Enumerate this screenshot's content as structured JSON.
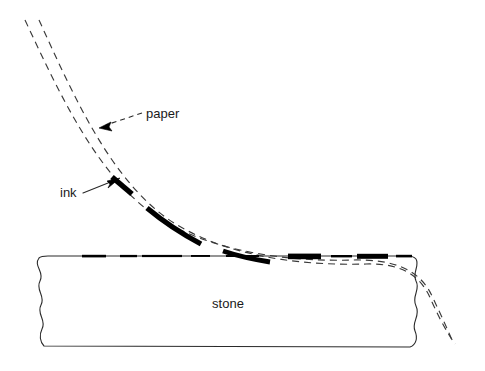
{
  "figure": {
    "type": "technical-cross-section-diagram",
    "background_color": "#ffffff",
    "line_color": "#1a1a1a",
    "ink_color": "#000000"
  },
  "labels": {
    "paper": "paper",
    "ink": "ink",
    "stone": "stone"
  },
  "label_positions": {
    "paper": {
      "x": 146,
      "y": 115,
      "anchor": "start"
    },
    "ink": {
      "x": 60,
      "y": 194,
      "anchor": "start"
    },
    "stone": {
      "x": 228,
      "y": 305,
      "anchor": "middle"
    }
  },
  "leaders": {
    "paper": {
      "style": "dashed",
      "path": "M 142 114 L 101 127",
      "arrow_at": {
        "x": 99,
        "y": 128
      },
      "arrow_angle_deg": 198
    },
    "ink": {
      "style": "solid",
      "path": "M 84 192 L 116 180",
      "arrow_at": {
        "x": 118,
        "y": 179
      },
      "arrow_angle_deg": -21
    }
  },
  "geometry": {
    "stone_block": {
      "left_edge_style": "wavy-break-line",
      "right_edge_style": "wavy-break-line",
      "top_y": 256,
      "bottom_y": 347,
      "left_x": 39,
      "right_x": 418
    },
    "paper_outer_curve": {
      "description": "upper surface of paper sheet, dashed",
      "path": "M 25 20 C 60 95 95 170 150 212 C 205 252 290 262 352 260 C 395 259 420 270 432 296 C 441 315 447 328 452 340"
    },
    "paper_inner_curve": {
      "description": "lower surface of paper sheet, dashed, ink adheres here",
      "path": "M 39 20 C 74 97 110 178 168 219 C 222 256 300 266 366 264 C 404 263 422 277 432 302 C 440 320 448 334 455 344"
    },
    "ink_marks_on_paper": [
      {
        "path": "M 113 178 L 131 193",
        "width": 5.2
      },
      {
        "path": "M 148 209 C 166 224 186 236 200 243",
        "width": 5.0
      },
      {
        "path": "M 222 250 C 240 256 256 259 268 261",
        "width": 5.0
      }
    ],
    "ink_marks_on_stone": [
      {
        "x": 82,
        "y": 256,
        "w": 24,
        "h": 2.6
      },
      {
        "x": 120,
        "y": 256,
        "w": 18,
        "h": 2.4
      },
      {
        "x": 130,
        "y": 256,
        "w": 42,
        "h": 2.2
      },
      {
        "x": 190,
        "y": 256,
        "w": 20,
        "h": 1.8
      },
      {
        "x": 224,
        "y": 256,
        "w": 34,
        "h": 2.0
      },
      {
        "x": 288,
        "y": 257,
        "w": 32,
        "h": 5.5
      },
      {
        "x": 330,
        "y": 257,
        "w": 22,
        "h": 2.4
      },
      {
        "x": 358,
        "y": 257,
        "w": 30,
        "h": 5.0
      },
      {
        "x": 396,
        "y": 257,
        "w": 16,
        "h": 2.6
      }
    ],
    "dash_pattern_paper": "7 5",
    "dash_pattern_leader": "5 4"
  }
}
